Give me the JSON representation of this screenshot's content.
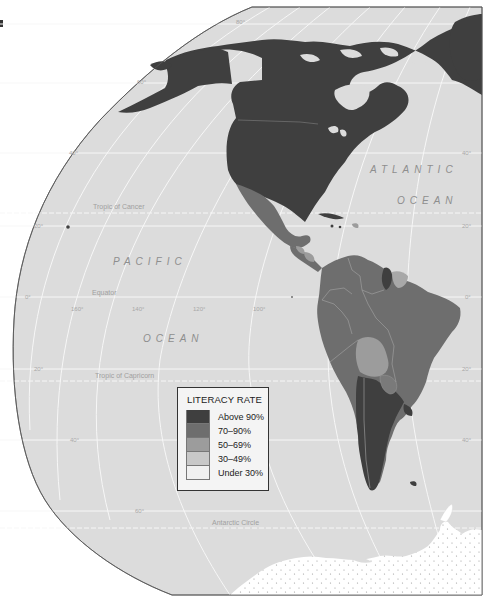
{
  "map": {
    "title": "Literacy Rate — The Americas",
    "colors": {
      "ocean": "#dcdcdc",
      "graticule": "#f5f5f5",
      "outline": "#555555",
      "antarctica": "#ffffff",
      "above_90": "#3f3f3f",
      "p70_90": "#6e6e6e",
      "p50_69": "#9c9c9c",
      "p30_49": "#c8c8c8",
      "under_30": "#f0f0f0"
    },
    "ocean_labels": {
      "atlantic_1": "ATLANTIC",
      "atlantic_2": "OCEAN",
      "pacific_1": "PACIFIC",
      "pacific_2": "OCEAN"
    },
    "special_lines": {
      "tropic_cancer": "Tropic of Cancer",
      "equator": "Equator",
      "tropic_capricorn": "Tropic of Capricorn",
      "antarctic_circle": "Antarctic Circle"
    },
    "latitude_labels": [
      "80°",
      "60°",
      "40°",
      "20°",
      "0°",
      "20°",
      "40°",
      "60°"
    ],
    "longitude_labels": [
      "160°",
      "140°",
      "120°",
      "100°"
    ],
    "right_lat_labels": [
      "40°",
      "20°",
      "0°",
      "20°",
      "40°"
    ]
  },
  "legend": {
    "title": "LITERACY RATE",
    "items": [
      {
        "label": "Above 90%",
        "color": "#3f3f3f"
      },
      {
        "label": "70–90%",
        "color": "#6e6e6e"
      },
      {
        "label": "50–69%",
        "color": "#9c9c9c"
      },
      {
        "label": "30–49%",
        "color": "#c8c8c8"
      },
      {
        "label": "Under 30%",
        "color": "#f0f0f0"
      }
    ]
  }
}
